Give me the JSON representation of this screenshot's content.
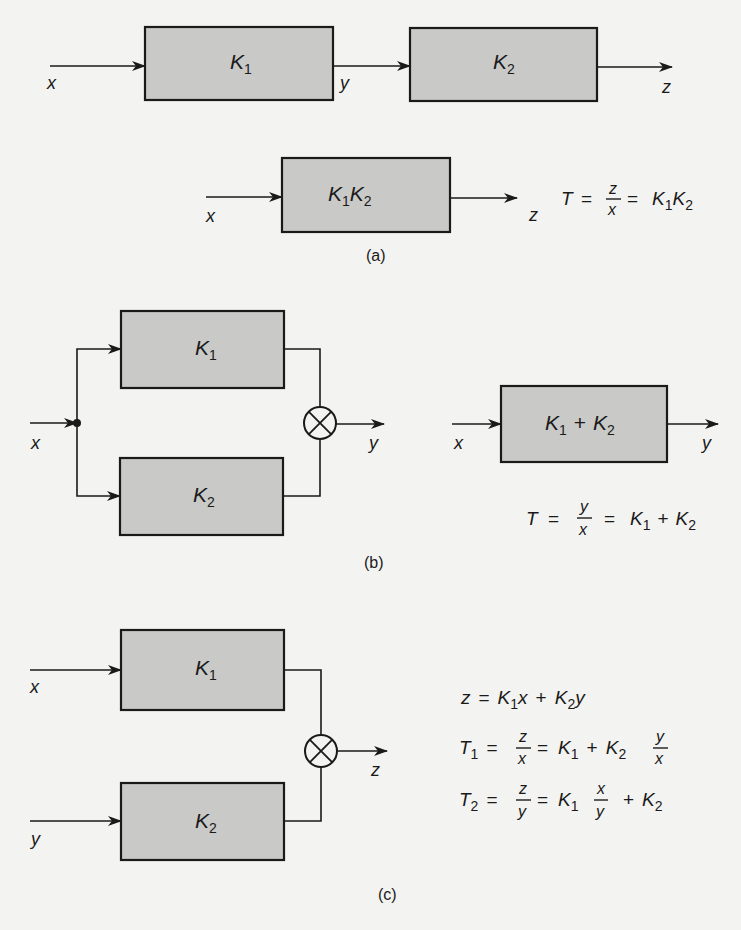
{
  "figure": {
    "panel_a": {
      "caption": "(a)",
      "series": {
        "input": "x",
        "intermediate": "y",
        "output": "z",
        "block1": {
          "main": "K",
          "sub": "1"
        },
        "block2": {
          "main": "K",
          "sub": "2"
        }
      },
      "equivalent": {
        "input": "x",
        "output": "z",
        "block": {
          "k1": "K",
          "s1": "1",
          "k2": "K",
          "s2": "2"
        }
      },
      "equation": {
        "lhs": "T",
        "eq1": "=",
        "num": "z",
        "den": "x",
        "eq2": "=",
        "r1": "K",
        "r1s": "1",
        "r2": "K",
        "r2s": "2"
      }
    },
    "panel_b": {
      "caption": "(b)",
      "parallel": {
        "input": "x",
        "output": "y",
        "block1": {
          "main": "K",
          "sub": "1"
        },
        "block2": {
          "main": "K",
          "sub": "2"
        },
        "summer": "multiply-circle"
      },
      "equivalent": {
        "input": "x",
        "output": "y",
        "block": {
          "k1": "K",
          "s1": "1",
          "plus": "+",
          "k2": "K",
          "s2": "2"
        }
      },
      "equation": {
        "lhs": "T",
        "eq1": "=",
        "num": "y",
        "den": "x",
        "eq2": "=",
        "r1": "K",
        "r1s": "1",
        "plus": "+",
        "r2": "K",
        "r2s": "2"
      }
    },
    "panel_c": {
      "caption": "(c)",
      "inputs": [
        "x",
        "y"
      ],
      "output": "z",
      "block1": {
        "main": "K",
        "sub": "1"
      },
      "block2": {
        "main": "K",
        "sub": "2"
      },
      "summer": "multiply-circle",
      "equations": {
        "line1": {
          "lhs": "z",
          "eq": "=",
          "a": "K",
          "as": "1",
          "av": "x",
          "plus": "+",
          "b": "K",
          "bs": "2",
          "bv": "y"
        },
        "line2": {
          "lhs": "T",
          "lhss": "1",
          "eq1": "=",
          "num": "z",
          "den": "x",
          "eq2": "=",
          "a": "K",
          "as": "1",
          "plus": "+",
          "b": "K",
          "bs": "2",
          "fnum": "y",
          "fden": "x"
        },
        "line3": {
          "lhs": "T",
          "lhss": "2",
          "eq1": "=",
          "num": "z",
          "den": "y",
          "eq2": "=",
          "a": "K",
          "as": "1",
          "fnum": "x",
          "fden": "y",
          "plus": "+",
          "b": "K",
          "bs": "2"
        }
      }
    }
  },
  "colors": {
    "background": "#f3f3f1",
    "block_fill": "#c9c9c7",
    "line": "#1a1a1a"
  }
}
